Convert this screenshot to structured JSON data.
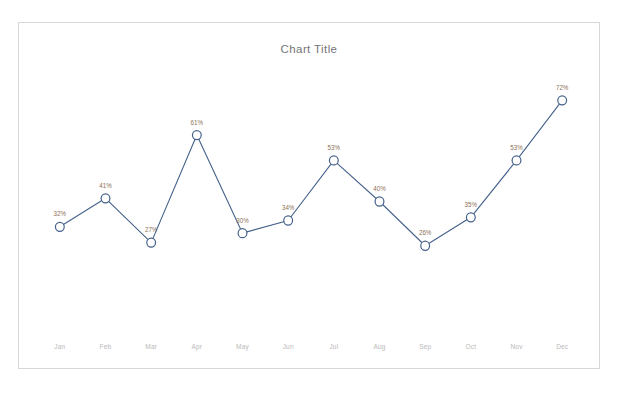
{
  "chart_data": {
    "type": "line",
    "title": "Chart Title",
    "xlabel": "",
    "ylabel": "",
    "ylim": [
      0,
      80
    ],
    "grid": false,
    "legend": "none",
    "axis": {
      "x_visible": true,
      "y_visible": false
    },
    "categories": [
      "Jan",
      "Feb",
      "Mar",
      "Apr",
      "May",
      "Jun",
      "Jul",
      "Aug",
      "Sep",
      "Oct",
      "Nov",
      "Dec"
    ],
    "values": [
      32,
      41,
      27,
      61,
      30,
      34,
      53,
      40,
      26,
      35,
      53,
      72
    ],
    "data_labels": [
      "32%",
      "41%",
      "27%",
      "61%",
      "30%",
      "34%",
      "53%",
      "40%",
      "26%",
      "35%",
      "53%",
      "72%"
    ],
    "series": [
      {
        "name": "Series 1",
        "values": [
          32,
          41,
          27,
          61,
          30,
          34,
          53,
          40,
          26,
          35,
          53,
          72
        ],
        "marker": "circle-open",
        "line_color": "#44618a",
        "marker_fill": "#ffffff"
      }
    ]
  },
  "style": {
    "line_color": "#44618a",
    "marker_stroke": "#44618a",
    "marker_fill": "#ffffff",
    "label_color": "#8c6f55",
    "tick_color": "#b9b9b9",
    "title_color": "#757575",
    "frame_border": "#d8d8d8",
    "background": "#ffffff"
  },
  "caption": {
    "line1": "",
    "line2": ""
  }
}
